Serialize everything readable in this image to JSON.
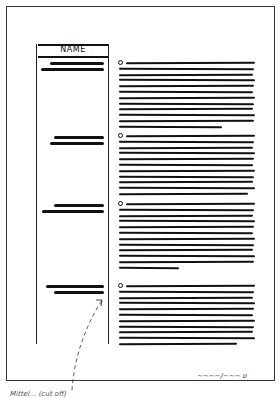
{
  "document": {
    "sidebar": {
      "header": "NAME"
    },
    "sections": [
      {
        "bullet_y": 62,
        "line_count": 12,
        "last_line_width": 103,
        "redact_y": [
          62,
          68
        ],
        "redact_widths": [
          54,
          63
        ]
      },
      {
        "bullet_y": 135,
        "line_count": 11,
        "last_line_width": 129,
        "redact_y": [
          136,
          142
        ],
        "redact_widths": [
          50,
          54
        ]
      },
      {
        "bullet_y": 203,
        "line_count": 12,
        "last_line_width": 60,
        "redact_y": [
          204,
          210
        ],
        "redact_widths": [
          50,
          62
        ]
      },
      {
        "bullet_y": 285,
        "line_count": 11,
        "last_line_width": 118,
        "redact_y": [
          285,
          291
        ],
        "redact_widths": [
          58,
          50
        ]
      }
    ],
    "signature": "~~~~/~~~ ʋ",
    "caption": "Mittel... (handwritten, cut off)"
  },
  "colors": {
    "ink": "#111111",
    "paper": "#ffffff"
  }
}
